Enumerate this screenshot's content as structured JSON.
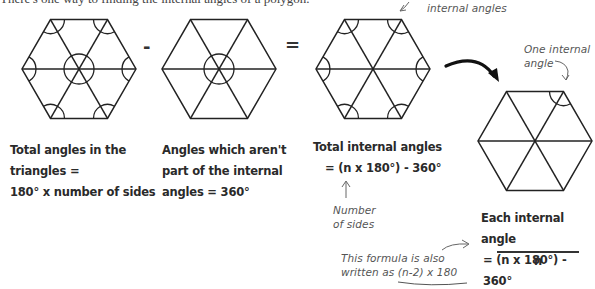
{
  "header": {
    "intro_text": "There's one way to finding the internal angles of a polygon."
  },
  "operators": {
    "minus": "-",
    "equals": "="
  },
  "captions": {
    "total_triangles": {
      "line1": "Total angles in the",
      "line2": "triangles =",
      "line3": "180° x number of sides"
    },
    "not_internal": {
      "line1": "Angles which aren't",
      "line2": "part of the internal",
      "line3": "angles = 360°"
    },
    "total_internal": {
      "line1": "Total internal angles",
      "line2": "= (n x 180°) - 360°"
    },
    "each_internal": {
      "line1": "Each internal angle",
      "numerator": "= (n x 180°) - 360°",
      "denominator": "n"
    }
  },
  "annotations": {
    "internal_angles": "internal angles",
    "one_internal_angle_line1": "One internal",
    "one_internal_angle_line2": "angle",
    "number_of_sides_line1": "Number",
    "number_of_sides_line2": "of sides",
    "formula_note_line1": "This formula is also",
    "formula_note_line2_prefix": "written as ",
    "formula_note_line2_formula": "(n-2) x 180"
  },
  "diagrams": {
    "hexagon_all_angles": {
      "center": [
        79,
        69
      ],
      "radius": 57,
      "marked": "all triangle angles"
    },
    "hexagon_center_angles": {
      "center": [
        219,
        69
      ],
      "radius": 57,
      "marked": "center angles"
    },
    "hexagon_internal_angles": {
      "center": [
        373,
        69
      ],
      "radius": 57,
      "marked": "internal angles"
    },
    "hexagon_one_angle": {
      "center": [
        535,
        141
      ],
      "radius": 57,
      "marked": "one internal angle"
    }
  },
  "colors": {
    "line": "#222222",
    "text": "#2a2a2a",
    "annotation": "#555555",
    "background": "#ffffff"
  }
}
